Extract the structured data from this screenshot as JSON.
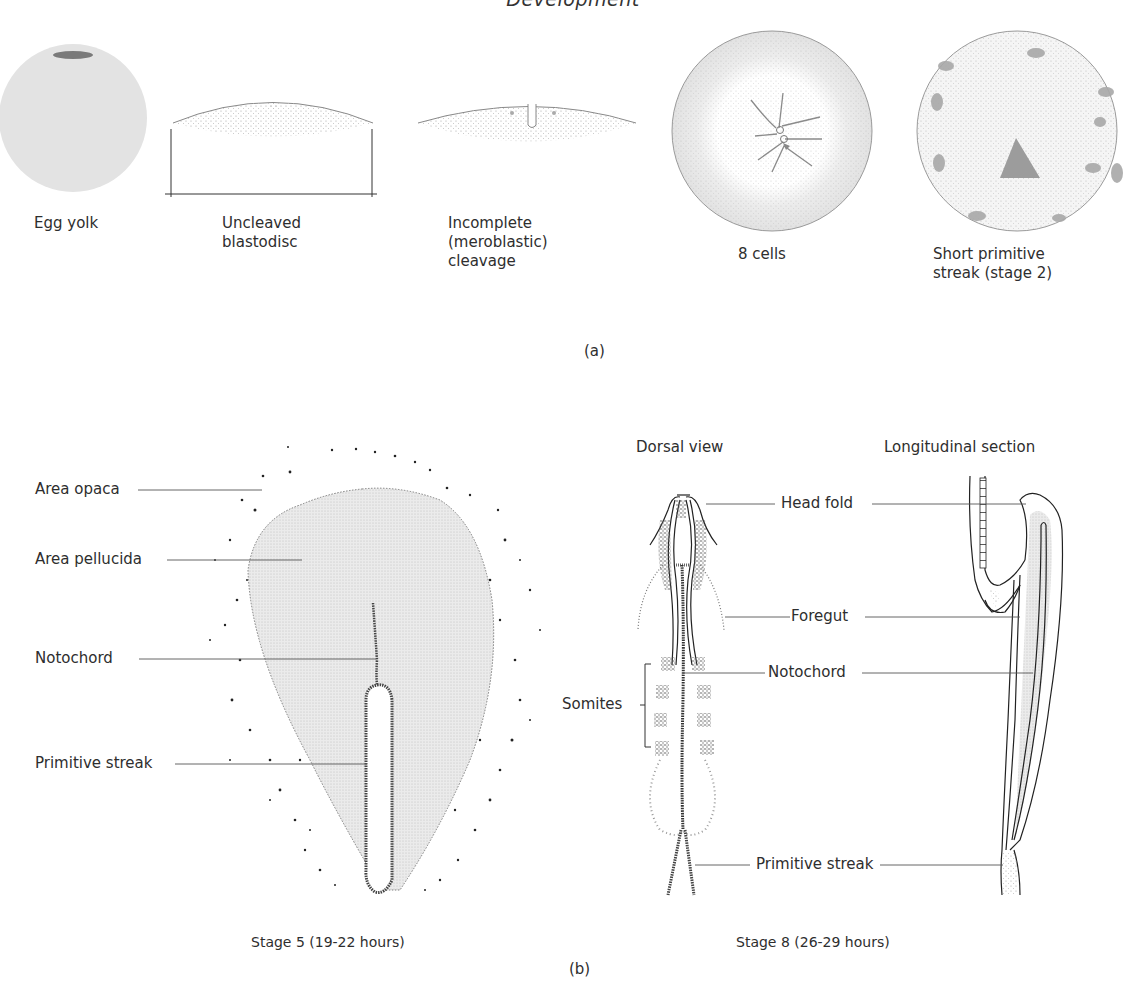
{
  "figure": {
    "title": "Development",
    "panels": [
      {
        "id": "a",
        "letter": "(a)",
        "stages": [
          {
            "label": "Egg yolk"
          },
          {
            "label": "Uncleaved\nblastodisc"
          },
          {
            "label": "Incomplete\n(meroblastic)\ncleavage"
          },
          {
            "label": "8 cells"
          },
          {
            "label": "Short primitive\nstreak (stage 2)"
          }
        ]
      },
      {
        "id": "b",
        "letter": "(b)",
        "stage5": {
          "caption": "Stage 5 (19-22 hours)",
          "labels": {
            "area_opaca": "Area opaca",
            "area_pellucida": "Area pellucida",
            "notochord": "Notochord",
            "primitive_streak": "Primitive streak"
          }
        },
        "stage8": {
          "caption": "Stage 8 (26-29 hours)",
          "views": {
            "dorsal": "Dorsal view",
            "longitudinal": "Longitudinal section"
          },
          "labels": {
            "head_fold": "Head fold",
            "foregut": "Foregut",
            "notochord": "Notochord",
            "somites": "Somites",
            "primitive_streak": "Primitive streak"
          }
        }
      }
    ]
  },
  "colors": {
    "ink": "#2a2a2a",
    "stipple": "#9a9a9a",
    "yolk_fill": "#e2e2e2",
    "pellucida_fill": "#e4e4e4"
  }
}
